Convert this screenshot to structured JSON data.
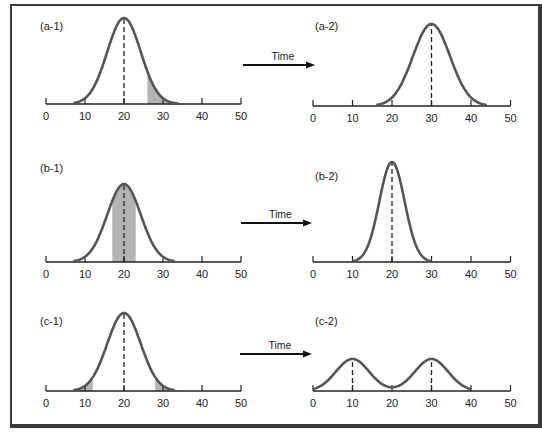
{
  "figure": {
    "arrow_label": "Time",
    "axis_ticks": [
      "0",
      "10",
      "20",
      "30",
      "40",
      "50"
    ],
    "colors": {
      "curve": "#555555",
      "shade": "#b3b3b3",
      "axis": "#222222",
      "frame": "#3a3a3a"
    }
  },
  "panels": [
    {
      "id": "a-1",
      "label": "(a-1)",
      "mean": 20,
      "shade": "right tail 26-34"
    },
    {
      "id": "a-2",
      "label": "(a-2)",
      "mean": 30
    },
    {
      "id": "b-1",
      "label": "(b-1)",
      "mean": 20,
      "shade": "center 17-23"
    },
    {
      "id": "b-2",
      "label": "(b-2)",
      "mean": 20,
      "note": "narrower distribution"
    },
    {
      "id": "c-1",
      "label": "(c-1)",
      "mean": 20,
      "shade": "both tails 7-12 and 28-34"
    },
    {
      "id": "c-2",
      "label": "(c-2)",
      "modes": [
        10,
        30
      ],
      "note": "bimodal"
    }
  ],
  "arrows": [
    {
      "label": "Time",
      "from": "a-1",
      "to": "a-2"
    },
    {
      "label": "Time",
      "from": "b-1",
      "to": "b-2"
    },
    {
      "label": "Time",
      "from": "c-1",
      "to": "c-2"
    }
  ]
}
